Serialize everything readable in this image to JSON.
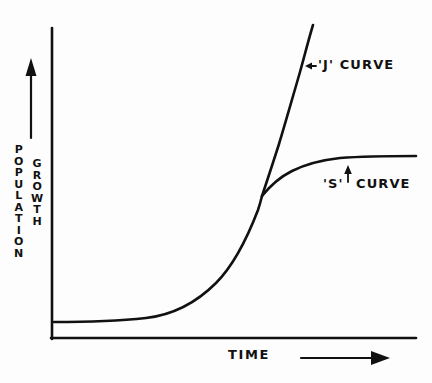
{
  "figure": {
    "background_color": "#fdfdfd",
    "ink_color": "#111111"
  },
  "axes": {
    "y_axis": {
      "label_primary": "POPULATION",
      "label_secondary": "GROWTH",
      "direction_icon": "up-arrow-icon"
    },
    "x_axis": {
      "label": "TIME",
      "direction_icon": "right-arrow-icon"
    }
  },
  "annotations": [
    {
      "id": "j-curve",
      "text": "'J' CURVE",
      "pointer_icon": "left-arrow-icon",
      "pointer_direction": "left"
    },
    {
      "id": "s-curve",
      "text_lead": "'S'",
      "text_trail": "CURVE",
      "pointer_icon": "up-arrow-icon",
      "pointer_direction": "up"
    }
  ],
  "chart_data": {
    "type": "line",
    "xlabel": "TIME",
    "ylabel": "POPULATION GROWTH",
    "xlim": [
      0,
      100
    ],
    "ylim": [
      0,
      100
    ],
    "grid": false,
    "axis_ticks": false,
    "legend": "inline-annotations",
    "style": "hand-drawn",
    "series": [
      {
        "name": "'J' CURVE",
        "description": "Exponential growth — rises without limit",
        "x": [
          0,
          10,
          20,
          30,
          40,
          50,
          55,
          60,
          65,
          68,
          70,
          72,
          74,
          76,
          78,
          80
        ],
        "y": [
          4,
          4.5,
          5.5,
          8,
          13,
          24,
          32,
          42,
          55,
          63,
          70,
          78,
          85,
          92,
          97,
          100
        ]
      },
      {
        "name": "'S' CURVE",
        "description": "Logistic growth — levels off at carrying capacity",
        "x": [
          0,
          10,
          20,
          30,
          40,
          50,
          55,
          60,
          63,
          66,
          70,
          75,
          80,
          85,
          90,
          95,
          100
        ],
        "y": [
          4,
          4.5,
          5.5,
          8,
          13,
          24,
          32,
          42,
          48,
          55,
          62,
          66,
          68,
          69,
          69.5,
          70,
          70
        ]
      }
    ],
    "divergence_point": {
      "x": 60,
      "y": 42
    },
    "carrying_capacity": 70
  }
}
